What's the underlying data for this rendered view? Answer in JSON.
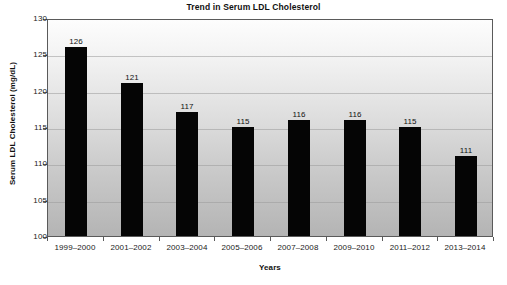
{
  "chart_data": {
    "type": "bar",
    "title": "Trend in Serum LDL Cholesterol",
    "xlabel": "Years",
    "ylabel": "Serum LDL Cholesterol (mg/dL)",
    "categories": [
      "1999–2000",
      "2001–2002",
      "2003–2004",
      "2005–2006",
      "2007–2008",
      "2009–2010",
      "2011–2012",
      "2013–2014"
    ],
    "values": [
      126,
      121,
      117,
      115,
      116,
      116,
      115,
      111
    ],
    "data_labels": [
      "126",
      "121",
      "117",
      "115",
      "116",
      "116",
      "115",
      "111"
    ],
    "ylim": [
      100,
      130
    ],
    "yticks": [
      100,
      105,
      110,
      115,
      120,
      125,
      130
    ],
    "ytick_labels": [
      "100",
      "105",
      "110",
      "115",
      "120",
      "125",
      "130"
    ],
    "grid": true,
    "legend": "none",
    "bar_color": "#050505",
    "plot_background": "gradient-white-to-gray",
    "border_color": "#5a5a5a"
  }
}
